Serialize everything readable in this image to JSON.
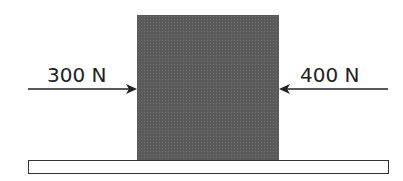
{
  "diagram": {
    "forces": [
      {
        "label": "300 N",
        "direction": "right",
        "side": "left"
      },
      {
        "label": "400 N",
        "direction": "left",
        "side": "right"
      }
    ],
    "block": {
      "color": "#5a5a5a"
    },
    "surface": {
      "color": "#ffffff",
      "border": "#333333"
    }
  }
}
